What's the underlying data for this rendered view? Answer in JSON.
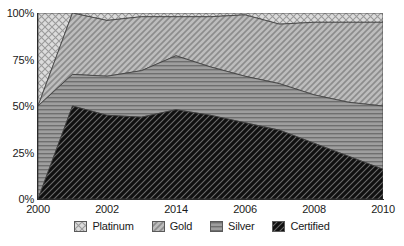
{
  "chart_data": {
    "type": "area",
    "stacked": true,
    "normalized": true,
    "title": "",
    "subtitle": "",
    "xlabel": "",
    "ylabel": "",
    "grid": false,
    "legend_position": "bottom",
    "x": [
      2000,
      2001,
      2002,
      2003,
      2004,
      2005,
      2006,
      2007,
      2008,
      2009,
      2010
    ],
    "x_tick_labels": [
      "2000",
      "2002",
      "2014",
      "2006",
      "2008",
      "2010"
    ],
    "x_tick_values": [
      2000,
      2002,
      2004,
      2006,
      2008,
      2010
    ],
    "xlim": [
      2000,
      2010
    ],
    "y_tick_labels": [
      "0%",
      "25%",
      "50%",
      "75%",
      "100%"
    ],
    "y_tick_values": [
      0,
      25,
      50,
      75,
      100
    ],
    "ylim": [
      0,
      100
    ],
    "categories": [
      "2000",
      "2001",
      "2002",
      "2003",
      "2004",
      "2005",
      "2006",
      "2007",
      "2008",
      "2009",
      "2010"
    ],
    "series": [
      {
        "name": "Certified",
        "pattern": "diagonal-dark",
        "color": "#121212",
        "values": [
          0,
          50,
          45,
          44,
          48,
          45,
          41,
          37,
          30,
          23,
          16
        ]
      },
      {
        "name": "Silver",
        "pattern": "horizontal-lines",
        "color": "#8f8f8f",
        "values": [
          50,
          17,
          21,
          25,
          29,
          26,
          25,
          25,
          26,
          29,
          34
        ]
      },
      {
        "name": "Gold",
        "pattern": "diagonal-light",
        "color": "#b5b5b5",
        "values": [
          0,
          33,
          30,
          29,
          21,
          27,
          33,
          32,
          39,
          43,
          45
        ]
      },
      {
        "name": "Platinum",
        "pattern": "crosshatch",
        "color": "#d8d8d8",
        "values": [
          50,
          0,
          4,
          2,
          2,
          2,
          1,
          6,
          5,
          5,
          5
        ]
      }
    ],
    "cumulative_tops": {
      "certified": [
        0,
        50,
        45,
        44,
        48,
        45,
        41,
        37,
        30,
        23,
        16
      ],
      "silver": [
        50,
        67,
        66,
        69,
        77,
        71,
        66,
        62,
        56,
        52,
        50
      ],
      "gold": [
        50,
        100,
        96,
        98,
        98,
        98,
        99,
        94,
        95,
        95,
        95
      ],
      "platinum": [
        100,
        100,
        100,
        100,
        100,
        100,
        100,
        100,
        100,
        100,
        100
      ]
    }
  },
  "legend": {
    "items": [
      {
        "label": "Platinum"
      },
      {
        "label": "Gold"
      },
      {
        "label": "Silver"
      },
      {
        "label": "Certified"
      }
    ]
  }
}
